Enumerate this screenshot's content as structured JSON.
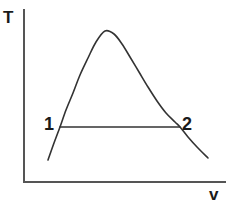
{
  "figure": {
    "background_color": "#ffffff",
    "line_color": "#333333",
    "axis_color": "#555555",
    "text_color": "#1a1a1a"
  },
  "axes": {
    "y_label": "T",
    "x_label": "v",
    "y_axis": {
      "x": 24,
      "y_top": 10,
      "y_bottom": 182
    },
    "x_axis": {
      "y": 182,
      "x_left": 24,
      "x_right": 225
    }
  },
  "annotations": [
    {
      "name": "state-point-1",
      "label": "1",
      "x": 60,
      "y": 127
    },
    {
      "name": "state-point-2",
      "label": "2",
      "x": 180,
      "y": 127
    }
  ],
  "chart_data": {
    "type": "line",
    "xlabel": "v",
    "ylabel": "T",
    "grid": false,
    "legend": null,
    "xlim": [
      24,
      225
    ],
    "ylim": [
      10,
      182
    ],
    "series": [
      {
        "name": "saturation-dome-curve",
        "comment": "Bell / dome shaped curve in pixel coordinates, y measured downward",
        "points": [
          [
            48,
            160
          ],
          [
            54,
            143
          ],
          [
            60,
            127
          ],
          [
            66,
            110
          ],
          [
            73,
            93
          ],
          [
            80,
            75
          ],
          [
            88,
            58
          ],
          [
            96,
            42
          ],
          [
            105,
            31
          ],
          [
            114,
            34
          ],
          [
            122,
            44
          ],
          [
            130,
            57
          ],
          [
            139,
            72
          ],
          [
            148,
            87
          ],
          [
            157,
            101
          ],
          [
            166,
            113
          ],
          [
            175,
            122
          ],
          [
            180,
            127
          ],
          [
            188,
            137
          ],
          [
            197,
            147
          ],
          [
            208,
            158
          ]
        ]
      },
      {
        "name": "constant-temperature-line",
        "comment": "Horizontal isotherm chord connecting state 1 to state 2",
        "points": [
          [
            60,
            127
          ],
          [
            180,
            127
          ]
        ]
      }
    ]
  }
}
